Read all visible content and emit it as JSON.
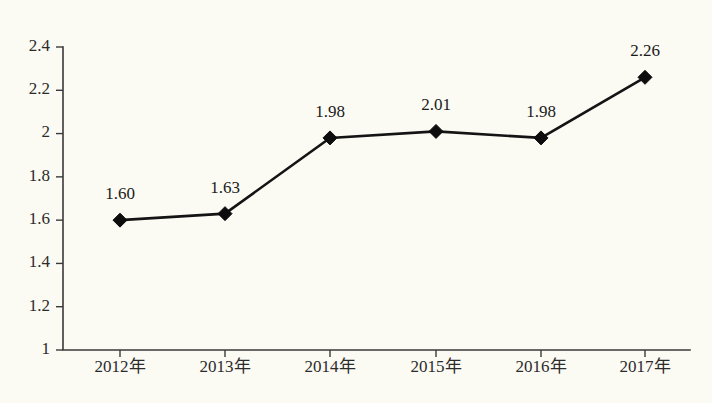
{
  "chart_data": {
    "type": "line",
    "title": "",
    "subtitle": "",
    "xlabel": "",
    "ylabel": "",
    "categories": [
      "2012年",
      "2013年",
      "2014年",
      "2015年",
      "2016年",
      "2017年"
    ],
    "values": [
      1.6,
      1.63,
      1.98,
      2.01,
      1.98,
      2.26
    ],
    "point_labels": [
      "1.60",
      "1.63",
      "1.98",
      "2.01",
      "1.98",
      "2.26"
    ],
    "ylim": [
      1,
      2.4
    ],
    "y_ticks": [
      1,
      1.2,
      1.4,
      1.6,
      1.8,
      2,
      2.2,
      2.4
    ],
    "y_tick_labels": [
      "1",
      "1.2",
      "1.4",
      "1.6",
      "1.8",
      "2",
      "2.2",
      "2.4"
    ],
    "grid": false,
    "legend": false,
    "legend_position": "none",
    "marker": "diamond",
    "line_color": "#141414",
    "marker_color": "#0d0d0d",
    "axis_color": "#3a3a3a",
    "background_color": "#fbfaf3",
    "text_color": "#2b2b2b"
  },
  "layout": {
    "plot_left": 63,
    "plot_right": 690,
    "plot_top": 47,
    "plot_bottom": 350,
    "x_positions": [
      120,
      225,
      330,
      436,
      541,
      645
    ],
    "tick_length": 7,
    "label_offset": 30,
    "marker_size": 14
  }
}
